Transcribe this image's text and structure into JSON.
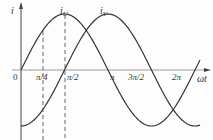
{
  "diagram": {
    "y_axis_label": "i",
    "x_axis_label": "ωt",
    "origin_label": "0",
    "curves": [
      {
        "name": "iU",
        "label_main": "i",
        "label_sub": "U",
        "phase_shift": 0
      },
      {
        "name": "iV",
        "label_main": "i",
        "label_sub": "V",
        "phase_shift": 1.5708
      }
    ],
    "x_ticks": [
      "π/4",
      "π/2",
      "π",
      "3π/2",
      "2π"
    ],
    "dashed_markers": [
      "π/4",
      "π/2"
    ],
    "stroke_color": "#333333"
  }
}
